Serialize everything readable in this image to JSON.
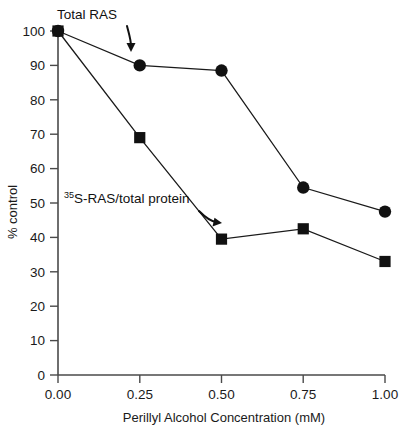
{
  "chart_data": {
    "type": "line",
    "title": "",
    "xlabel": "Perillyl Alcohol Concentration (mM)",
    "ylabel": "% control",
    "x": [
      0.0,
      0.25,
      0.5,
      0.75,
      1.0
    ],
    "xticklabels": [
      "0.00",
      "0.25",
      "0.50",
      "0.75",
      "1.00"
    ],
    "yticks": [
      0,
      10,
      20,
      30,
      40,
      50,
      60,
      70,
      80,
      90,
      100
    ],
    "yticklabels": [
      "0",
      "10",
      "20",
      "30",
      "40",
      "50",
      "60",
      "70",
      "80",
      "90",
      "100"
    ],
    "xlim": [
      0.0,
      1.0
    ],
    "ylim": [
      0,
      100
    ],
    "grid": false,
    "legend": "none",
    "series": [
      {
        "name": "Total RAS",
        "marker": "circle",
        "values": [
          100,
          90,
          88.5,
          54.5,
          47.5
        ]
      },
      {
        "name": "35S-RAS/total protein",
        "marker": "square",
        "values": [
          100,
          69,
          39.5,
          42.5,
          33
        ]
      }
    ],
    "annotations": [
      {
        "id": "total-ras",
        "text": "Total RAS",
        "text_plain": "Total RAS",
        "superscript": "",
        "arrow": "curved-down-right"
      },
      {
        "id": "s35-ras",
        "text": "S-RAS/total protein",
        "text_plain": "35S-RAS/total protein",
        "superscript": "35",
        "arrow": "curved-down-right"
      }
    ]
  },
  "axes": {
    "x_title": "Perillyl Alcohol Concentration (mM)",
    "y_title": "% control"
  }
}
